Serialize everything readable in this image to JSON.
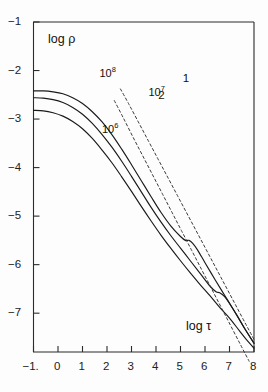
{
  "chart_data": {
    "type": "line",
    "title": "",
    "xlabel": "log τ",
    "ylabel": "log ρ",
    "xlim": [
      -1,
      8
    ],
    "ylim": [
      -7.8,
      -1
    ],
    "grid": false,
    "legend_position": "inline-labels",
    "x_ticks": [
      -1,
      0,
      1,
      2,
      3,
      4,
      5,
      6,
      7,
      8
    ],
    "x_tick_labels": [
      "−1.",
      "0",
      "1",
      "2",
      "3",
      "4",
      "5",
      "6",
      "7",
      "8"
    ],
    "y_ticks": [
      -1,
      -2,
      -3,
      -4,
      -5,
      -6,
      -7
    ],
    "y_tick_labels": [
      "−1",
      "−2",
      "−3",
      "−4",
      "−5",
      "−6",
      "−7"
    ],
    "series": [
      {
        "name": "10^8",
        "label": "10",
        "exponent": "8",
        "style": "solid",
        "color": "#1a1a1a",
        "x": [
          -1.0,
          -0.6,
          -0.2,
          0.2,
          0.6,
          1.0,
          1.4,
          1.8,
          2.2,
          2.6,
          3.0,
          3.4,
          3.8,
          4.2,
          4.6,
          5.0,
          5.2,
          5.35,
          5.5,
          5.7,
          6.0,
          6.4,
          6.8,
          7.2,
          7.6,
          8.0
        ],
        "y": [
          -2.42,
          -2.42,
          -2.44,
          -2.48,
          -2.56,
          -2.68,
          -2.85,
          -3.06,
          -3.32,
          -3.62,
          -3.94,
          -4.27,
          -4.6,
          -4.92,
          -5.2,
          -5.42,
          -5.5,
          -5.5,
          -5.56,
          -5.7,
          -5.96,
          -6.3,
          -6.63,
          -6.96,
          -7.3,
          -7.62
        ]
      },
      {
        "name": "10^7",
        "label": "10",
        "exponent": "7",
        "style": "solid",
        "color": "#1a1a1a",
        "x": [
          -1.0,
          -0.6,
          -0.2,
          0.2,
          0.6,
          1.0,
          1.4,
          1.8,
          2.2,
          2.6,
          3.0,
          3.4,
          3.8,
          4.2,
          4.6,
          5.0,
          5.4,
          5.8,
          6.2,
          6.45,
          6.6,
          6.8,
          7.0,
          7.3,
          7.6,
          8.0
        ],
        "y": [
          -2.56,
          -2.57,
          -2.6,
          -2.66,
          -2.76,
          -2.9,
          -3.09,
          -3.32,
          -3.58,
          -3.87,
          -4.18,
          -4.5,
          -4.82,
          -5.12,
          -5.4,
          -5.66,
          -5.92,
          -6.18,
          -6.44,
          -6.56,
          -6.58,
          -6.66,
          -6.8,
          -7.04,
          -7.3,
          -7.62
        ]
      },
      {
        "name": "10^6",
        "label": "10",
        "exponent": "6",
        "style": "solid",
        "color": "#1a1a1a",
        "x": [
          -1.0,
          -0.6,
          -0.2,
          0.2,
          0.6,
          1.0,
          1.4,
          1.8,
          2.2,
          2.6,
          3.0,
          3.4,
          3.8,
          4.2,
          4.6,
          5.0,
          5.4,
          5.8,
          6.2,
          6.6,
          7.0,
          7.4,
          7.7,
          8.0
        ],
        "y": [
          -2.82,
          -2.83,
          -2.87,
          -2.94,
          -3.05,
          -3.2,
          -3.4,
          -3.64,
          -3.9,
          -4.19,
          -4.49,
          -4.8,
          -5.1,
          -5.39,
          -5.66,
          -5.92,
          -6.17,
          -6.41,
          -6.64,
          -6.88,
          -7.1,
          -7.36,
          -7.55,
          -7.72
        ]
      },
      {
        "name": "1",
        "label": "1",
        "style": "dashed",
        "color": "#3a3a3a",
        "x": [
          2.55,
          2.9,
          3.3,
          3.7,
          4.1,
          4.5,
          4.9,
          5.3,
          5.7,
          6.1,
          6.5,
          6.9,
          7.3,
          7.7,
          8.0
        ],
        "y": [
          -2.38,
          -2.7,
          -3.08,
          -3.46,
          -3.84,
          -4.22,
          -4.6,
          -4.98,
          -5.36,
          -5.74,
          -6.12,
          -6.5,
          -6.88,
          -7.26,
          -7.54
        ]
      },
      {
        "name": "2",
        "label": "2",
        "style": "dashed",
        "color": "#3a3a3a",
        "x": [
          2.3,
          2.65,
          3.05,
          3.45,
          3.85,
          4.25,
          4.65,
          5.05,
          5.45,
          5.85,
          6.25,
          6.65,
          7.05,
          7.45,
          7.8
        ],
        "y": [
          -2.62,
          -2.96,
          -3.36,
          -3.75,
          -4.14,
          -4.53,
          -4.92,
          -5.31,
          -5.7,
          -6.09,
          -6.48,
          -6.87,
          -7.26,
          -7.65,
          -7.99
        ]
      }
    ],
    "annotations": [
      {
        "name": "curve-label-10e8",
        "text": "10",
        "exponent": "8",
        "x": 2.1,
        "y": -2.05
      },
      {
        "name": "curve-label-10e7",
        "text": "10",
        "exponent": "7",
        "x": 4.1,
        "y": -2.45
      },
      {
        "name": "curve-label-10e6",
        "text": "10",
        "exponent": "6",
        "x": 2.2,
        "y": -3.2
      },
      {
        "name": "dashed-label-1",
        "text": "1",
        "x": 5.5,
        "y": -2.2
      },
      {
        "name": "dashed-label-2",
        "text": "2",
        "x": 4.5,
        "y": -2.55
      }
    ]
  },
  "axis_titles": {
    "y": "log ρ",
    "x": "log τ"
  }
}
